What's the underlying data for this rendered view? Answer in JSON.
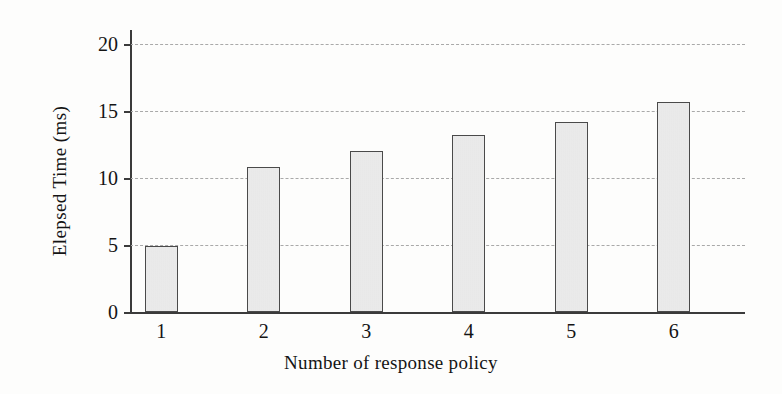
{
  "chart_data": {
    "type": "bar",
    "title": "",
    "xlabel": "Number of response policy",
    "ylabel": "Elepsed Time (ms)",
    "categories": [
      "1",
      "2",
      "3",
      "4",
      "5",
      "6"
    ],
    "values": [
      4.9,
      10.8,
      12.0,
      13.2,
      14.2,
      15.7
    ],
    "ylim": [
      0,
      20
    ],
    "yticks": [
      0,
      5,
      10,
      15,
      20
    ],
    "ytick_labels": [
      "0",
      "5",
      "10",
      "15",
      "20"
    ],
    "xtick_labels": [
      "1",
      "2",
      "3",
      "4",
      "5",
      "6"
    ],
    "grid": "horizontal-dashed",
    "legend": "none",
    "series": [
      {
        "name": "Elepsed Time",
        "values": [
          4.9,
          10.8,
          12.0,
          13.2,
          14.2,
          15.7
        ]
      }
    ],
    "colors": {
      "bar_fill": "#e2e2e2",
      "bar_edge": "#4a4a4a",
      "axis": "#3b3b3b",
      "gridline": "#a9a9a9",
      "text": "#141414",
      "background": "#fdfdfc"
    }
  }
}
